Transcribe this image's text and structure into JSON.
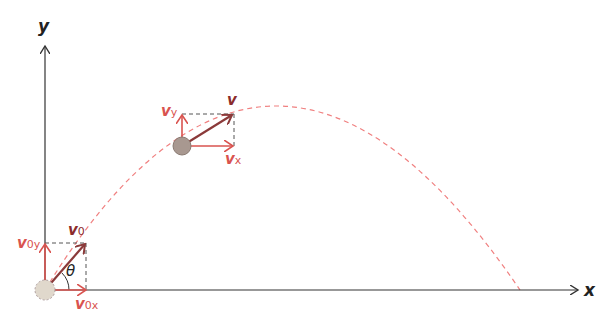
{
  "diagram": {
    "axes": {
      "x_label": "x",
      "y_label": "y"
    },
    "labels": {
      "v0": "v",
      "v0_sub": "0",
      "v0x": "v",
      "v0x_sub": "0x",
      "v0y": "v",
      "v0y_sub": "0y",
      "theta": "θ",
      "v": "v",
      "vx": "v",
      "vx_sub": "x",
      "vy": "v",
      "vy_sub": "y"
    },
    "colors": {
      "axis": "#333333",
      "vector_dark": "#8b3a3a",
      "component": "#d9534f",
      "trajectory": "#f08080",
      "label_red": "#d9534f",
      "label_dark": "#8b2c2c",
      "ball_start": "#e0d8cc",
      "ball_mid": "#a89890"
    }
  }
}
